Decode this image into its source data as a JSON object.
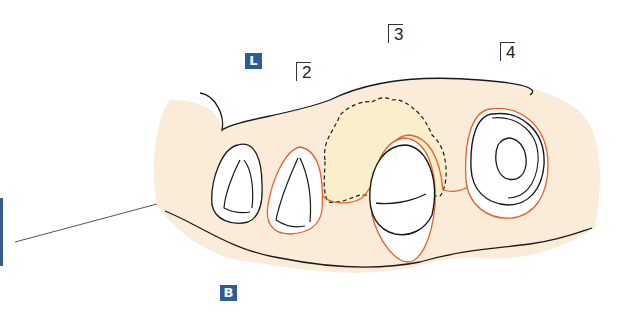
{
  "labels": {
    "lingual": "L",
    "buccal": "B"
  },
  "tooth_numbers": [
    "2",
    "3",
    "4"
  ],
  "colors": {
    "gingiva_fill": "#fbecd9",
    "graft_fill": "#f9efcc",
    "outline": "#1a1a1a",
    "margin_line": "#e8602c",
    "badge": "#2e5d96"
  }
}
